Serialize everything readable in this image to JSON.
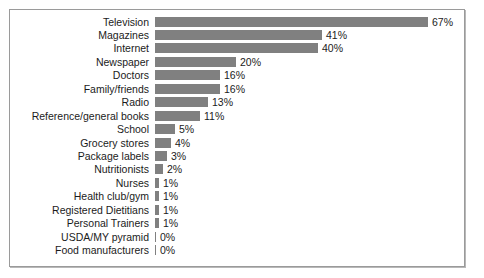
{
  "chart_data": {
    "type": "bar",
    "orientation": "horizontal",
    "title": "",
    "subtitle": "",
    "xlabel": "",
    "ylabel": "",
    "xlim": [
      0,
      70
    ],
    "grid": false,
    "legend": null,
    "value_suffix": "%",
    "bar_color": "#808080",
    "frame_color": "#9a9a9a",
    "text_color": "#1b1b1b",
    "categories": [
      "Television",
      "Magazines",
      "Internet",
      "Newspaper",
      "Doctors",
      "Family/friends",
      "Radio",
      "Reference/general books",
      "School",
      "Grocery stores",
      "Package labels",
      "Nutritionists",
      "Nurses",
      "Health club/gym",
      "Registered Dietitians",
      "Personal Trainers",
      "USDA/MY pyramid",
      "Food manufacturers"
    ],
    "values": [
      67,
      41,
      40,
      20,
      16,
      16,
      13,
      11,
      5,
      4,
      3,
      2,
      1,
      1,
      1,
      1,
      0,
      0
    ],
    "value_labels": [
      "67%",
      "41%",
      "40%",
      "20%",
      "16%",
      "16%",
      "13%",
      "11%",
      "5%",
      "4%",
      "3%",
      "2%",
      "1%",
      "1%",
      "1%",
      "1%",
      "0%",
      "0%"
    ]
  }
}
